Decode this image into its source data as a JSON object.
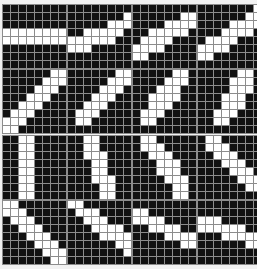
{
  "figure": {
    "type": "binary-pattern-array",
    "rows": 4,
    "cols": 4,
    "grid_size": 8,
    "on_color": "#ffffff",
    "off_color": "#111111",
    "gridline_color": "#8c8c8c",
    "background_color": "#f2f2f2"
  },
  "patterns": [
    {
      "index": 0,
      "name": "orientation-000",
      "angle_deg": 0,
      "grid": [
        [
          0,
          0,
          0,
          0,
          0,
          0,
          0,
          0
        ],
        [
          0,
          0,
          0,
          0,
          0,
          0,
          0,
          0
        ],
        [
          0,
          0,
          0,
          0,
          0,
          0,
          0,
          0
        ],
        [
          1,
          1,
          1,
          1,
          1,
          1,
          1,
          1
        ],
        [
          1,
          1,
          1,
          1,
          1,
          1,
          1,
          1
        ],
        [
          0,
          0,
          0,
          0,
          0,
          0,
          0,
          0
        ],
        [
          0,
          0,
          0,
          0,
          0,
          0,
          0,
          0
        ],
        [
          0,
          0,
          0,
          0,
          0,
          0,
          0,
          0
        ]
      ]
    },
    {
      "index": 1,
      "name": "orientation-011",
      "angle_deg": 11,
      "grid": [
        [
          0,
          0,
          0,
          0,
          0,
          0,
          0,
          0
        ],
        [
          0,
          0,
          0,
          0,
          0,
          0,
          0,
          1
        ],
        [
          0,
          0,
          0,
          0,
          0,
          1,
          1,
          1
        ],
        [
          0,
          0,
          1,
          1,
          1,
          1,
          1,
          0
        ],
        [
          1,
          1,
          1,
          1,
          1,
          1,
          0,
          0
        ],
        [
          1,
          1,
          1,
          0,
          0,
          0,
          0,
          0
        ],
        [
          0,
          0,
          0,
          0,
          0,
          0,
          0,
          0
        ],
        [
          0,
          0,
          0,
          0,
          0,
          0,
          0,
          0
        ]
      ]
    },
    {
      "index": 2,
      "name": "orientation-022",
      "angle_deg": 22,
      "grid": [
        [
          0,
          0,
          0,
          0,
          0,
          0,
          0,
          0
        ],
        [
          0,
          0,
          0,
          0,
          0,
          0,
          1,
          1
        ],
        [
          0,
          0,
          0,
          0,
          1,
          1,
          1,
          1
        ],
        [
          0,
          0,
          1,
          1,
          1,
          1,
          1,
          0
        ],
        [
          0,
          1,
          1,
          1,
          1,
          0,
          0,
          0
        ],
        [
          1,
          1,
          1,
          1,
          0,
          0,
          0,
          0
        ],
        [
          1,
          1,
          0,
          0,
          0,
          0,
          0,
          0
        ],
        [
          0,
          0,
          0,
          0,
          0,
          0,
          0,
          0
        ]
      ]
    },
    {
      "index": 3,
      "name": "orientation-034",
      "angle_deg": 34,
      "grid": [
        [
          0,
          0,
          0,
          0,
          0,
          0,
          0,
          1
        ],
        [
          0,
          0,
          0,
          0,
          0,
          0,
          1,
          1
        ],
        [
          0,
          0,
          0,
          0,
          1,
          1,
          1,
          1
        ],
        [
          0,
          0,
          0,
          1,
          1,
          1,
          1,
          0
        ],
        [
          0,
          1,
          1,
          1,
          1,
          0,
          0,
          0
        ],
        [
          1,
          1,
          1,
          1,
          0,
          0,
          0,
          0
        ],
        [
          1,
          1,
          0,
          0,
          0,
          0,
          0,
          0
        ],
        [
          0,
          0,
          0,
          0,
          0,
          0,
          0,
          0
        ]
      ]
    },
    {
      "index": 4,
      "name": "orientation-045",
      "angle_deg": 45,
      "grid": [
        [
          0,
          0,
          0,
          0,
          0,
          0,
          1,
          1
        ],
        [
          0,
          0,
          0,
          0,
          0,
          1,
          1,
          1
        ],
        [
          0,
          0,
          0,
          0,
          1,
          1,
          1,
          0
        ],
        [
          0,
          0,
          0,
          1,
          1,
          1,
          0,
          0
        ],
        [
          0,
          0,
          1,
          1,
          1,
          0,
          0,
          0
        ],
        [
          0,
          1,
          1,
          1,
          0,
          0,
          0,
          0
        ],
        [
          1,
          1,
          1,
          0,
          0,
          0,
          0,
          0
        ],
        [
          1,
          1,
          0,
          0,
          0,
          0,
          0,
          0
        ]
      ]
    },
    {
      "index": 5,
      "name": "orientation-056",
      "angle_deg": 56,
      "grid": [
        [
          0,
          0,
          0,
          0,
          0,
          0,
          1,
          1
        ],
        [
          0,
          0,
          0,
          0,
          0,
          1,
          1,
          1
        ],
        [
          0,
          0,
          0,
          0,
          1,
          1,
          1,
          0
        ],
        [
          0,
          0,
          0,
          1,
          1,
          1,
          0,
          0
        ],
        [
          0,
          0,
          1,
          1,
          1,
          0,
          0,
          0
        ],
        [
          0,
          1,
          1,
          1,
          0,
          0,
          0,
          0
        ],
        [
          0,
          1,
          1,
          0,
          0,
          0,
          0,
          0
        ],
        [
          0,
          0,
          0,
          0,
          0,
          0,
          0,
          0
        ]
      ]
    },
    {
      "index": 6,
      "name": "orientation-067",
      "angle_deg": 67,
      "grid": [
        [
          0,
          0,
          0,
          0,
          0,
          1,
          1,
          0
        ],
        [
          0,
          0,
          0,
          0,
          1,
          1,
          1,
          0
        ],
        [
          0,
          0,
          0,
          1,
          1,
          1,
          0,
          0
        ],
        [
          0,
          0,
          1,
          1,
          1,
          1,
          0,
          0
        ],
        [
          0,
          0,
          1,
          1,
          1,
          0,
          0,
          0
        ],
        [
          0,
          1,
          1,
          1,
          0,
          0,
          0,
          0
        ],
        [
          0,
          1,
          1,
          0,
          0,
          0,
          0,
          0
        ],
        [
          0,
          0,
          0,
          0,
          0,
          0,
          0,
          0
        ]
      ]
    },
    {
      "index": 7,
      "name": "orientation-079",
      "angle_deg": 79,
      "grid": [
        [
          0,
          0,
          0,
          0,
          0,
          1,
          1,
          0
        ],
        [
          0,
          0,
          0,
          0,
          1,
          1,
          1,
          0
        ],
        [
          0,
          0,
          0,
          0,
          1,
          1,
          1,
          0
        ],
        [
          0,
          0,
          0,
          1,
          1,
          1,
          0,
          0
        ],
        [
          0,
          0,
          0,
          1,
          1,
          1,
          0,
          0
        ],
        [
          0,
          0,
          1,
          1,
          1,
          0,
          0,
          0
        ],
        [
          0,
          0,
          1,
          1,
          0,
          0,
          0,
          0
        ],
        [
          0,
          0,
          0,
          0,
          0,
          0,
          0,
          0
        ]
      ]
    },
    {
      "index": 8,
      "name": "orientation-090",
      "angle_deg": 90,
      "grid": [
        [
          0,
          0,
          1,
          1,
          0,
          0,
          0,
          0
        ],
        [
          0,
          0,
          1,
          1,
          0,
          0,
          0,
          0
        ],
        [
          0,
          0,
          1,
          1,
          0,
          0,
          0,
          0
        ],
        [
          0,
          0,
          1,
          1,
          0,
          0,
          0,
          0
        ],
        [
          0,
          0,
          1,
          1,
          0,
          0,
          0,
          0
        ],
        [
          0,
          0,
          1,
          1,
          0,
          0,
          0,
          0
        ],
        [
          0,
          0,
          1,
          1,
          0,
          0,
          0,
          0
        ],
        [
          0,
          0,
          1,
          1,
          0,
          0,
          0,
          0
        ]
      ]
    },
    {
      "index": 9,
      "name": "orientation-101",
      "angle_deg": 101,
      "grid": [
        [
          0,
          0,
          1,
          1,
          0,
          0,
          0,
          0
        ],
        [
          0,
          0,
          1,
          1,
          0,
          0,
          0,
          0
        ],
        [
          0,
          0,
          1,
          1,
          1,
          0,
          0,
          0
        ],
        [
          0,
          0,
          0,
          1,
          1,
          0,
          0,
          0
        ],
        [
          0,
          0,
          0,
          1,
          1,
          0,
          0,
          0
        ],
        [
          0,
          0,
          0,
          1,
          1,
          1,
          0,
          0
        ],
        [
          0,
          0,
          0,
          0,
          1,
          1,
          0,
          0
        ],
        [
          0,
          0,
          0,
          0,
          1,
          1,
          0,
          0
        ]
      ]
    },
    {
      "index": 10,
      "name": "orientation-112",
      "angle_deg": 112,
      "grid": [
        [
          0,
          1,
          1,
          0,
          0,
          0,
          0,
          0
        ],
        [
          0,
          1,
          1,
          1,
          0,
          0,
          0,
          0
        ],
        [
          0,
          0,
          1,
          1,
          1,
          0,
          0,
          0
        ],
        [
          0,
          0,
          0,
          1,
          1,
          1,
          0,
          0
        ],
        [
          0,
          0,
          0,
          1,
          1,
          1,
          0,
          0
        ],
        [
          0,
          0,
          0,
          0,
          1,
          1,
          1,
          0
        ],
        [
          0,
          0,
          0,
          0,
          0,
          1,
          1,
          0
        ],
        [
          0,
          0,
          0,
          0,
          0,
          1,
          1,
          0
        ]
      ]
    },
    {
      "index": 11,
      "name": "orientation-124",
      "angle_deg": 124,
      "grid": [
        [
          0,
          1,
          1,
          0,
          0,
          0,
          0,
          0
        ],
        [
          0,
          1,
          1,
          1,
          0,
          0,
          0,
          0
        ],
        [
          0,
          0,
          1,
          1,
          1,
          0,
          0,
          0
        ],
        [
          0,
          0,
          0,
          1,
          1,
          1,
          0,
          0
        ],
        [
          0,
          0,
          0,
          0,
          1,
          1,
          1,
          0
        ],
        [
          0,
          0,
          0,
          0,
          0,
          1,
          1,
          1
        ],
        [
          0,
          0,
          0,
          0,
          0,
          0,
          1,
          1
        ],
        [
          0,
          0,
          0,
          0,
          0,
          0,
          0,
          0
        ]
      ]
    },
    {
      "index": 12,
      "name": "orientation-135",
      "angle_deg": 135,
      "grid": [
        [
          1,
          1,
          0,
          0,
          0,
          0,
          0,
          0
        ],
        [
          1,
          1,
          1,
          0,
          0,
          0,
          0,
          0
        ],
        [
          0,
          1,
          1,
          1,
          0,
          0,
          0,
          0
        ],
        [
          0,
          0,
          1,
          1,
          1,
          0,
          0,
          0
        ],
        [
          0,
          0,
          0,
          1,
          1,
          1,
          0,
          0
        ],
        [
          0,
          0,
          0,
          0,
          1,
          1,
          1,
          0
        ],
        [
          0,
          0,
          0,
          0,
          0,
          1,
          1,
          1
        ],
        [
          0,
          0,
          0,
          0,
          0,
          0,
          1,
          1
        ]
      ]
    },
    {
      "index": 13,
      "name": "orientation-146",
      "angle_deg": 146,
      "grid": [
        [
          1,
          1,
          0,
          0,
          0,
          0,
          0,
          0
        ],
        [
          0,
          1,
          1,
          1,
          0,
          0,
          0,
          0
        ],
        [
          0,
          0,
          1,
          1,
          1,
          0,
          0,
          0
        ],
        [
          0,
          0,
          0,
          1,
          1,
          1,
          1,
          0
        ],
        [
          0,
          0,
          0,
          0,
          1,
          1,
          1,
          1
        ],
        [
          0,
          0,
          0,
          0,
          0,
          0,
          1,
          1
        ],
        [
          0,
          0,
          0,
          0,
          0,
          0,
          0,
          1
        ],
        [
          0,
          0,
          0,
          0,
          0,
          0,
          0,
          0
        ]
      ]
    },
    {
      "index": 14,
      "name": "orientation-157",
      "angle_deg": 157,
      "grid": [
        [
          0,
          0,
          0,
          0,
          0,
          0,
          0,
          0
        ],
        [
          1,
          1,
          0,
          0,
          0,
          0,
          0,
          0
        ],
        [
          1,
          1,
          1,
          1,
          0,
          0,
          0,
          0
        ],
        [
          0,
          0,
          1,
          1,
          1,
          1,
          0,
          0
        ],
        [
          0,
          0,
          0,
          0,
          1,
          1,
          1,
          1
        ],
        [
          0,
          0,
          0,
          0,
          0,
          0,
          1,
          1
        ],
        [
          0,
          0,
          0,
          0,
          0,
          0,
          0,
          0
        ],
        [
          0,
          0,
          0,
          0,
          0,
          0,
          0,
          0
        ]
      ]
    },
    {
      "index": 15,
      "name": "orientation-168",
      "angle_deg": 168,
      "grid": [
        [
          0,
          0,
          0,
          0,
          0,
          0,
          0,
          0
        ],
        [
          0,
          0,
          0,
          0,
          0,
          0,
          0,
          0
        ],
        [
          1,
          1,
          1,
          0,
          0,
          0,
          0,
          0
        ],
        [
          1,
          1,
          1,
          1,
          1,
          1,
          0,
          0
        ],
        [
          0,
          0,
          0,
          1,
          1,
          1,
          1,
          1
        ],
        [
          0,
          0,
          0,
          0,
          0,
          0,
          1,
          1
        ],
        [
          0,
          0,
          0,
          0,
          0,
          0,
          0,
          0
        ],
        [
          0,
          0,
          0,
          0,
          0,
          0,
          0,
          0
        ]
      ]
    }
  ]
}
